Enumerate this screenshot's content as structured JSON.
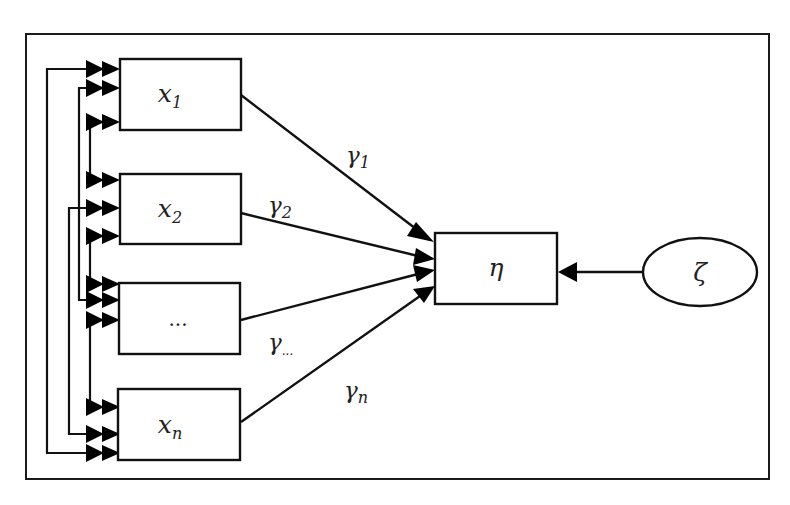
{
  "diagram": {
    "type": "structural-equation-path-diagram",
    "exogenous_nodes": [
      {
        "id": "x1",
        "base": "x",
        "sub": "1",
        "label": "x1"
      },
      {
        "id": "x2",
        "base": "x",
        "sub": "2",
        "label": "x2"
      },
      {
        "id": "xdots",
        "base": "...",
        "sub": "",
        "label": "..."
      },
      {
        "id": "xn",
        "base": "x",
        "sub": "n",
        "label": "xn"
      }
    ],
    "endogenous_node": {
      "id": "eta",
      "label": "η"
    },
    "error_node": {
      "id": "zeta",
      "label": "ζ",
      "shape": "ellipse"
    },
    "path_coefficients": [
      {
        "from": "x1",
        "to": "eta",
        "base": "γ",
        "sub": "1"
      },
      {
        "from": "x2",
        "to": "eta",
        "base": "γ",
        "sub": "2"
      },
      {
        "from": "xdots",
        "to": "eta",
        "base": "γ",
        "sub": "..."
      },
      {
        "from": "xn",
        "to": "eta",
        "base": "γ",
        "sub": "n"
      }
    ],
    "error_edge": {
      "from": "zeta",
      "to": "eta"
    },
    "covariances": [
      {
        "between": [
          "x1",
          "xn"
        ]
      },
      {
        "between": [
          "x1",
          "xdots"
        ]
      },
      {
        "between": [
          "x1",
          "x2"
        ]
      },
      {
        "between": [
          "x2",
          "xn"
        ]
      },
      {
        "between": [
          "x2",
          "xdots"
        ]
      },
      {
        "between": [
          "xdots",
          "xn"
        ]
      }
    ],
    "colors": {
      "stroke": "#111111",
      "background": "#ffffff",
      "text": "#222222"
    }
  }
}
